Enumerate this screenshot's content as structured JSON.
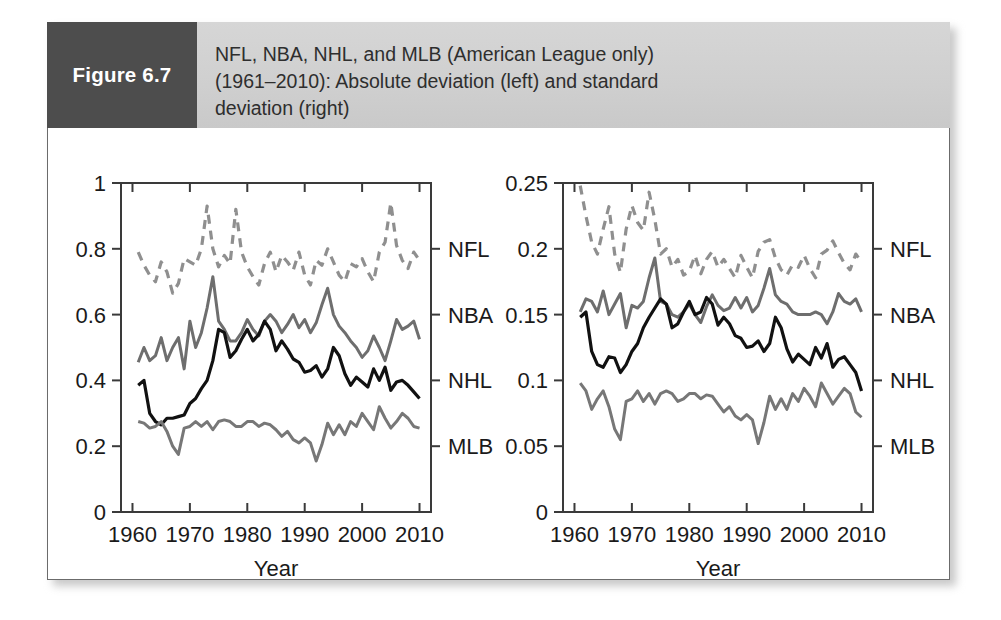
{
  "figure": {
    "tag": "Figure 6.7",
    "caption": "NFL, NBA, NHL, and MLB (American League only)\n(1961–2010): Absolute deviation (left) and standard\ndeviation (right)"
  },
  "colors": {
    "tag_background": "#4d4d4d",
    "caption_background": "#d0d0d0",
    "frame": "#6b6b6b",
    "nfl": "#8f8f8f",
    "nba": "#6e6e6e",
    "nhl": "#111111",
    "mlb": "#777777"
  },
  "chart_data": [
    {
      "type": "line",
      "id": "absolute-deviation",
      "title": "Absolute deviation (left)",
      "xlabel": "Year",
      "ylabel": "",
      "xlim": [
        1958,
        2012
      ],
      "ylim": [
        0,
        1
      ],
      "xticks": [
        1960,
        1970,
        1980,
        1990,
        2000,
        2010
      ],
      "xticklabels": [
        "1960",
        "1970",
        "1980",
        "1990",
        "2000",
        "2010"
      ],
      "yticks": [
        0,
        0.2,
        0.4,
        0.6,
        0.8,
        1
      ],
      "yticklabels": [
        "0",
        "0.2",
        "0.4",
        "0.6",
        "0.8",
        "1"
      ],
      "grid": false,
      "legend_position": "right-edge-labels",
      "legend_values": {
        "NFL": 0.8,
        "NBA": 0.6,
        "NHL": 0.4,
        "MLB": 0.2
      },
      "x": [
        1961,
        1962,
        1963,
        1964,
        1965,
        1966,
        1967,
        1968,
        1969,
        1970,
        1971,
        1972,
        1973,
        1974,
        1975,
        1976,
        1977,
        1978,
        1979,
        1980,
        1981,
        1982,
        1983,
        1984,
        1985,
        1986,
        1987,
        1988,
        1989,
        1990,
        1991,
        1992,
        1993,
        1994,
        1995,
        1996,
        1997,
        1998,
        1999,
        2000,
        2001,
        2002,
        2003,
        2004,
        2005,
        2006,
        2007,
        2008,
        2009,
        2010
      ],
      "series": [
        {
          "name": "NFL",
          "style": "dashed",
          "color": "#8f8f8f",
          "values": [
            0.79,
            0.75,
            0.72,
            0.7,
            0.76,
            0.73,
            0.665,
            0.695,
            0.77,
            0.76,
            0.75,
            0.8,
            0.93,
            0.8,
            0.745,
            0.78,
            0.755,
            0.92,
            0.79,
            0.745,
            0.715,
            0.69,
            0.755,
            0.79,
            0.73,
            0.78,
            0.76,
            0.735,
            0.79,
            0.72,
            0.69,
            0.765,
            0.75,
            0.8,
            0.76,
            0.72,
            0.7,
            0.755,
            0.745,
            0.77,
            0.73,
            0.7,
            0.79,
            0.82,
            0.94,
            0.81,
            0.765,
            0.74,
            0.79,
            0.765
          ]
        },
        {
          "name": "NBA",
          "style": "solid",
          "color": "#6e6e6e",
          "values": [
            0.455,
            0.5,
            0.46,
            0.475,
            0.53,
            0.46,
            0.5,
            0.53,
            0.435,
            0.58,
            0.5,
            0.545,
            0.62,
            0.715,
            0.58,
            0.555,
            0.52,
            0.52,
            0.545,
            0.585,
            0.555,
            0.535,
            0.58,
            0.6,
            0.58,
            0.545,
            0.57,
            0.6,
            0.56,
            0.585,
            0.545,
            0.575,
            0.63,
            0.68,
            0.6,
            0.565,
            0.545,
            0.52,
            0.5,
            0.47,
            0.49,
            0.535,
            0.5,
            0.46,
            0.52,
            0.585,
            0.555,
            0.565,
            0.58,
            0.525
          ]
        },
        {
          "name": "NHL",
          "style": "solid",
          "color": "#111111",
          "values": [
            0.385,
            0.4,
            0.3,
            0.275,
            0.265,
            0.285,
            0.285,
            0.29,
            0.295,
            0.33,
            0.345,
            0.375,
            0.4,
            0.46,
            0.555,
            0.545,
            0.47,
            0.49,
            0.525,
            0.555,
            0.52,
            0.54,
            0.58,
            0.555,
            0.49,
            0.52,
            0.495,
            0.465,
            0.455,
            0.425,
            0.43,
            0.445,
            0.41,
            0.435,
            0.5,
            0.475,
            0.42,
            0.385,
            0.41,
            0.395,
            0.38,
            0.435,
            0.4,
            0.44,
            0.37,
            0.395,
            0.4,
            0.385,
            0.365,
            0.345
          ]
        },
        {
          "name": "MLB",
          "style": "solid",
          "color": "#777777",
          "values": [
            0.275,
            0.27,
            0.255,
            0.26,
            0.275,
            0.245,
            0.2,
            0.175,
            0.255,
            0.26,
            0.275,
            0.26,
            0.275,
            0.25,
            0.275,
            0.28,
            0.275,
            0.26,
            0.26,
            0.275,
            0.275,
            0.26,
            0.27,
            0.265,
            0.25,
            0.23,
            0.245,
            0.22,
            0.21,
            0.225,
            0.21,
            0.155,
            0.205,
            0.27,
            0.235,
            0.265,
            0.235,
            0.275,
            0.26,
            0.3,
            0.275,
            0.25,
            0.32,
            0.285,
            0.255,
            0.275,
            0.3,
            0.285,
            0.26,
            0.255
          ]
        }
      ]
    },
    {
      "type": "line",
      "id": "standard-deviation",
      "title": "Standard deviation (right)",
      "xlabel": "Year",
      "ylabel": "",
      "xlim": [
        1958,
        2012
      ],
      "ylim": [
        0,
        0.25
      ],
      "xticks": [
        1960,
        1970,
        1980,
        1990,
        2000,
        2010
      ],
      "xticklabels": [
        "1960",
        "1970",
        "1980",
        "1990",
        "2000",
        "2010"
      ],
      "yticks": [
        0,
        0.05,
        0.1,
        0.15,
        0.2,
        0.25
      ],
      "yticklabels": [
        "0",
        "0.05",
        "0.1",
        "0.15",
        "0.2",
        "0.25"
      ],
      "grid": false,
      "legend_position": "right-edge-labels",
      "legend_values": {
        "NFL": 0.2,
        "NBA": 0.15,
        "NHL": 0.1,
        "MLB": 0.05
      },
      "x": [
        1961,
        1962,
        1963,
        1964,
        1965,
        1966,
        1967,
        1968,
        1969,
        1970,
        1971,
        1972,
        1973,
        1974,
        1975,
        1976,
        1977,
        1978,
        1979,
        1980,
        1981,
        1982,
        1983,
        1984,
        1985,
        1986,
        1987,
        1988,
        1989,
        1990,
        1991,
        1992,
        1993,
        1994,
        1995,
        1996,
        1997,
        1998,
        1999,
        2000,
        2001,
        2002,
        2003,
        2004,
        2005,
        2006,
        2007,
        2008,
        2009,
        2010
      ],
      "series": [
        {
          "name": "NFL",
          "style": "dashed",
          "color": "#8f8f8f",
          "values": [
            0.248,
            0.225,
            0.205,
            0.196,
            0.215,
            0.232,
            0.196,
            0.182,
            0.215,
            0.233,
            0.22,
            0.214,
            0.243,
            0.222,
            0.196,
            0.2,
            0.186,
            0.192,
            0.18,
            0.183,
            0.195,
            0.181,
            0.192,
            0.198,
            0.186,
            0.192,
            0.185,
            0.178,
            0.195,
            0.186,
            0.178,
            0.198,
            0.205,
            0.207,
            0.193,
            0.184,
            0.18,
            0.188,
            0.186,
            0.195,
            0.185,
            0.178,
            0.196,
            0.199,
            0.206,
            0.197,
            0.189,
            0.184,
            0.196,
            0.19
          ]
        },
        {
          "name": "NBA",
          "style": "solid",
          "color": "#6e6e6e",
          "values": [
            0.152,
            0.162,
            0.16,
            0.152,
            0.168,
            0.15,
            0.158,
            0.166,
            0.14,
            0.157,
            0.155,
            0.16,
            0.178,
            0.193,
            0.16,
            0.158,
            0.15,
            0.148,
            0.152,
            0.158,
            0.15,
            0.144,
            0.156,
            0.165,
            0.157,
            0.153,
            0.155,
            0.163,
            0.155,
            0.163,
            0.152,
            0.157,
            0.17,
            0.185,
            0.165,
            0.16,
            0.158,
            0.152,
            0.15,
            0.15,
            0.15,
            0.152,
            0.15,
            0.143,
            0.152,
            0.166,
            0.16,
            0.158,
            0.162,
            0.152
          ]
        },
        {
          "name": "NHL",
          "style": "solid",
          "color": "#111111",
          "values": [
            0.148,
            0.152,
            0.122,
            0.112,
            0.11,
            0.118,
            0.117,
            0.106,
            0.112,
            0.122,
            0.128,
            0.14,
            0.148,
            0.155,
            0.162,
            0.158,
            0.14,
            0.143,
            0.152,
            0.16,
            0.15,
            0.152,
            0.163,
            0.158,
            0.142,
            0.148,
            0.143,
            0.134,
            0.132,
            0.125,
            0.126,
            0.13,
            0.122,
            0.128,
            0.148,
            0.14,
            0.124,
            0.114,
            0.12,
            0.116,
            0.112,
            0.125,
            0.117,
            0.128,
            0.11,
            0.116,
            0.118,
            0.112,
            0.106,
            0.092
          ]
        },
        {
          "name": "MLB",
          "style": "solid",
          "color": "#777777",
          "values": [
            0.098,
            0.092,
            0.078,
            0.086,
            0.092,
            0.08,
            0.063,
            0.055,
            0.084,
            0.086,
            0.092,
            0.084,
            0.09,
            0.082,
            0.09,
            0.092,
            0.09,
            0.084,
            0.086,
            0.09,
            0.09,
            0.086,
            0.089,
            0.088,
            0.082,
            0.076,
            0.08,
            0.073,
            0.07,
            0.074,
            0.07,
            0.052,
            0.068,
            0.088,
            0.078,
            0.086,
            0.078,
            0.09,
            0.084,
            0.094,
            0.088,
            0.08,
            0.098,
            0.09,
            0.082,
            0.088,
            0.094,
            0.09,
            0.076,
            0.072
          ]
        }
      ]
    }
  ]
}
